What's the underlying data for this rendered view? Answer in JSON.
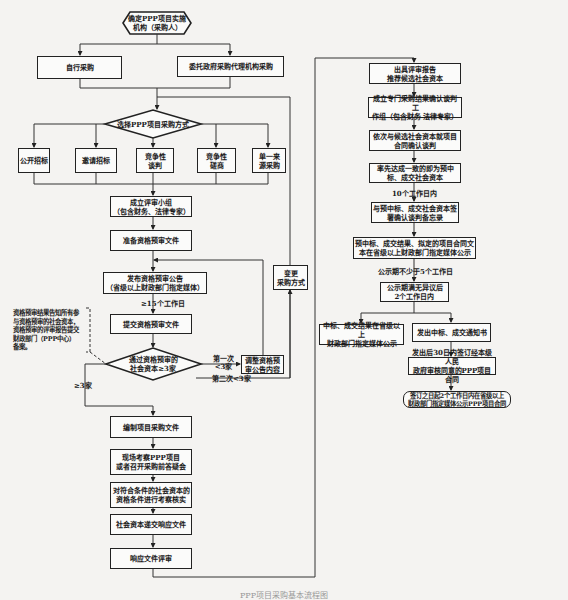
{
  "diagram": {
    "type": "flowchart",
    "caption": "PPP项目采购基本流程图",
    "start": {
      "label_line1": "确定PPP项目实施",
      "label_line2": "机构（采购人）"
    },
    "procurement_org": [
      {
        "label": "自行采购"
      },
      {
        "label": "委托政府采购代理机构采购"
      }
    ],
    "method_decision": {
      "label": "选择PPP项目采购方式"
    },
    "methods": [
      {
        "line1": "公开招标",
        "line2": ""
      },
      {
        "line1": "邀请招标",
        "line2": ""
      },
      {
        "line1": "竞争性",
        "line2": "谈判"
      },
      {
        "line1": "竞争性",
        "line2": "磋商"
      },
      {
        "line1": "单一来",
        "line2": "源采购"
      }
    ],
    "left_flow": {
      "form_panel": {
        "line1": "成立评审小组",
        "line2": "（包含财务、法律专家）"
      },
      "prepare_docs": {
        "label": "准备资格预审文件"
      },
      "publish_notice": {
        "line1": "发布资格预审公告",
        "line2": "（省级以上财政部门指定媒体）"
      },
      "days_15": "≥15个工作日",
      "submit_docs": {
        "label": "提交资格预审文件"
      },
      "qualify_decision": {
        "line1": "通过资格预审的",
        "line2": "社会资本≥3家"
      },
      "first_lt3": {
        "line1": "第一次",
        "line2": "<3家"
      },
      "second_lt3": "第二次<3家",
      "ge3": "≥3家",
      "adjust_notice": {
        "line1": "调整资格预",
        "line2": "审公告内容"
      },
      "change_method": {
        "line1": "变更",
        "line2": "采购方式"
      },
      "side_note": "资格预审结果告知所有参与资格预审的社会资本，资格预审的评审报告提交财政部门（PPP中心）备案。",
      "compile_docs": {
        "label": "编制项目采购文件"
      },
      "site_visit": {
        "line1": "现场考察PPP项目",
        "line2": "或者召开采购前答疑会"
      },
      "verify": {
        "line1": "对符合条件的社会资本的",
        "line2": "资格条件进行考察核实"
      },
      "submit_response": {
        "label": "社会资本递交响应文件"
      },
      "review_response": {
        "label": "响应文件评审"
      }
    },
    "right_flow": {
      "report": {
        "line1": "出具评审报告",
        "line2": "推荐候选社会资本"
      },
      "working_group": {
        "line1": "成立专门采购结果确认谈判工",
        "line2": "作组（包含财务  法律专家）"
      },
      "negotiate": {
        "line1": "依次与候选社会资本就项目",
        "line2": "合同确认谈判"
      },
      "first_agree": {
        "line1": "率先达成一致的即为预中",
        "line2": "标、成交社会资本"
      },
      "days_10": "10个工作日内",
      "memo": {
        "line1": "与预中标、成交社会资本签",
        "line2": "署确认谈判备忘录"
      },
      "publicize": {
        "line1": "预中标、成交结果、拟定的项目合同文",
        "line2": "本在省级以上财政部门指定媒体公示"
      },
      "days_5": "公示期不少于5个工作日",
      "no_objection": {
        "line1": "公示期满无异议后",
        "line2": "2个工作日内"
      },
      "announce_result": {
        "line1": "中标、成交结果在省级以上",
        "line2": "财政部门指定媒体公示"
      },
      "notice_letter": {
        "label": "发出中标、成交通知书"
      },
      "sign_contract": {
        "line1": "发出后30日内签订经本级人民",
        "line2": "政府审核同意的PPP项目合同"
      },
      "publish_contract": {
        "line1": "签订之日起2个工作日内在省级以上",
        "line2": "财政部门指定媒体公示PPP项目合同"
      }
    }
  }
}
